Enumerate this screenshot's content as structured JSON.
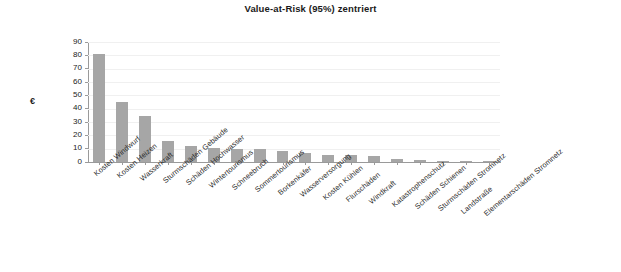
{
  "chart_data": {
    "type": "bar",
    "title": "Value-at-Risk (95%) zentriert",
    "xlabel": "",
    "ylabel": "Millionen",
    "yunit_symbol": "€",
    "ylim": [
      0,
      90
    ],
    "ytick_values": [
      0,
      10,
      20,
      30,
      40,
      50,
      60,
      70,
      80,
      90
    ],
    "ytick_labels": [
      "0",
      "10",
      "20",
      "30",
      "40",
      "50",
      "60",
      "70",
      "80",
      "90"
    ],
    "grid": true,
    "legend": "none",
    "bar_color": "#a6a6a6",
    "categories": [
      "Kosten Windwurf",
      "Kosten Heizen",
      "Wasserkraft",
      "Sturmschäden Gebäude",
      "Schäden Hochwasser",
      "Wintertourismus",
      "Schneebruch",
      "Sommertourismus",
      "Borkenkäfer",
      "Wasserversorgung",
      "Kosten Kühlen",
      "Flurschäden",
      "Windkraft",
      "Katastrophenschutz",
      "Schäden Schienen",
      "Sturmschäden Stromnetz",
      "Landstraße",
      "Elementarschäden Stromnetz"
    ],
    "values": [
      81,
      45,
      34.5,
      16,
      12,
      10.5,
      10,
      10,
      8.5,
      6.5,
      5.5,
      5,
      4.5,
      2,
      1.2,
      0.4,
      0.2,
      0.1
    ]
  }
}
